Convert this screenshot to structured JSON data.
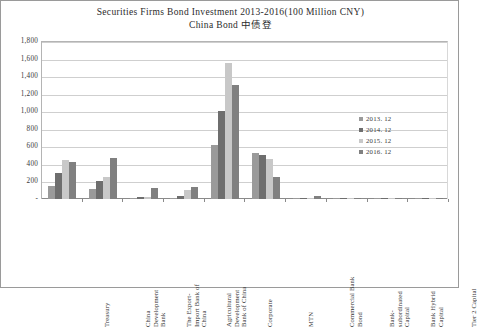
{
  "chart_data": {
    "type": "bar",
    "title": "Securities Firms Bond Investment 2013-2016(100 Million CNY)",
    "subtitle": "China Bond 中债登",
    "xlabel": "",
    "ylabel": "",
    "ylim": [
      0,
      1800
    ],
    "yticks": [
      "1,800",
      "1,600",
      "1,400",
      "1,200",
      "1,000",
      "800",
      "600",
      "400",
      "200",
      "-"
    ],
    "ytick_values": [
      1800,
      1600,
      1400,
      1200,
      1000,
      800,
      600,
      400,
      200,
      0
    ],
    "grid": true,
    "legend_position": "right-inside",
    "categories": [
      "Treasury",
      "China Development Bank",
      "The Export-Import Bank of China",
      "Agricultural Development Bank of China",
      "Corporate",
      "MTN",
      "Commercial Bank Bond",
      "Bank-subordinated Capital",
      "Bank Hybrid Capital",
      "Tier 2 Capital"
    ],
    "category_lines": [
      [
        "Treasury"
      ],
      [
        "China",
        "Development",
        "Bank"
      ],
      [
        "The Export-",
        "Import Bank of",
        "China"
      ],
      [
        "Agricultural",
        "Development",
        "Bank of China"
      ],
      [
        "Corporate"
      ],
      [
        "MTN"
      ],
      [
        "Commercial Bank",
        "Bond"
      ],
      [
        "Bank-",
        "subordinated",
        "Capital"
      ],
      [
        "Bank Hybrid",
        "Capital"
      ],
      [
        "Tier 2 Capital"
      ]
    ],
    "series": [
      {
        "name": "2013. 12",
        "color": "#9a9a9a",
        "values": [
          150,
          110,
          10,
          15,
          620,
          520,
          5,
          2,
          2,
          2
        ]
      },
      {
        "name": "2014. 12",
        "color": "#6e6e6e",
        "values": [
          300,
          200,
          20,
          40,
          1000,
          500,
          8,
          3,
          2,
          2
        ]
      },
      {
        "name": "2015. 12",
        "color": "#c8c8c8",
        "values": [
          440,
          250,
          20,
          100,
          1550,
          460,
          10,
          4,
          3,
          3
        ]
      },
      {
        "name": "2016. 12",
        "color": "#808080",
        "values": [
          420,
          470,
          120,
          140,
          1300,
          250,
          30,
          5,
          4,
          6
        ]
      }
    ]
  },
  "legend": {
    "items": [
      {
        "label": "2013. 12",
        "color": "#9a9a9a"
      },
      {
        "label": "2014. 12",
        "color": "#6e6e6e"
      },
      {
        "label": "2015. 12",
        "color": "#c8c8c8"
      },
      {
        "label": "2016. 12",
        "color": "#808080"
      }
    ]
  }
}
